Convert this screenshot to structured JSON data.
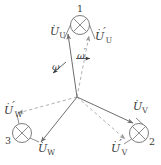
{
  "figure": {
    "background": "#ffffff",
    "stroke_solid": "#6e6e6e",
    "stroke_dashed": "#9a9a9a",
    "text_color": "#3a3a3a",
    "width": 161,
    "height": 165
  },
  "lamps": [
    {
      "id": "lamp-1",
      "label": "1",
      "symbol": "crossed-circle-lamp-icon",
      "cx": 80,
      "cy": 25,
      "r": 9.5
    },
    {
      "id": "lamp-2",
      "label": "2",
      "symbol": "crossed-circle-lamp-icon",
      "cx": 139,
      "cy": 133,
      "r": 9.5
    },
    {
      "id": "lamp-3",
      "label": "3",
      "symbol": "crossed-circle-lamp-icon",
      "cx": 22,
      "cy": 133,
      "r": 9.5
    }
  ],
  "phasors": {
    "solid": [
      {
        "name": "U-phasor",
        "label_base": "U",
        "label_dot": "·",
        "label_prime": "",
        "label_sub": "U"
      },
      {
        "name": "V-phasor",
        "label_base": "U",
        "label_dot": "·",
        "label_prime": "",
        "label_sub": "V"
      },
      {
        "name": "W-phasor",
        "label_base": "U",
        "label_dot": "·",
        "label_prime": "",
        "label_sub": "W"
      }
    ],
    "dashed": [
      {
        "name": "U-prime-phasor",
        "label_base": "U",
        "label_dot": "·",
        "label_prime": "′",
        "label_sub": "U"
      },
      {
        "name": "V-prime-phasor",
        "label_base": "U",
        "label_dot": "·",
        "label_prime": "′",
        "label_sub": "V"
      },
      {
        "name": "W-prime-phasor",
        "label_base": "U",
        "label_dot": "·",
        "label_prime": "′",
        "label_sub": "W"
      }
    ]
  },
  "labels": {
    "u": {
      "base": "U",
      "dot": "·",
      "prime": "",
      "sub": "U"
    },
    "u_prime": {
      "base": "U",
      "dot": "·",
      "prime": "′",
      "sub": "U"
    },
    "v": {
      "base": "U",
      "dot": "·",
      "prime": "",
      "sub": "V"
    },
    "v_prime": {
      "base": "U",
      "dot": "·",
      "prime": "′",
      "sub": "V"
    },
    "w": {
      "base": "U",
      "dot": "·",
      "prime": "",
      "sub": "W"
    },
    "w_prime": {
      "base": "U",
      "dot": "·",
      "prime": "′",
      "sub": "W"
    }
  },
  "angular": {
    "omega": {
      "symbol": "ω",
      "prime": "",
      "name": "omega-label"
    },
    "omega_prime": {
      "symbol": "ω",
      "prime": "′",
      "name": "omega-prime-label"
    }
  }
}
